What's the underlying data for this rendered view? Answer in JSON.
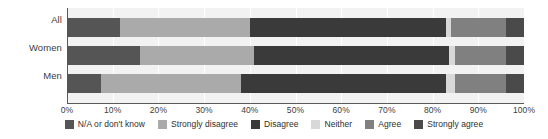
{
  "chart_data": {
    "type": "bar",
    "orientation": "horizontal",
    "stacked": true,
    "stack_mode": "percent",
    "title": "",
    "subtitle": "",
    "xlabel": "",
    "ylabel": "",
    "xlim": [
      0,
      100
    ],
    "xticks": [
      0,
      10,
      20,
      30,
      40,
      50,
      60,
      70,
      80,
      90,
      100
    ],
    "xticklabels": [
      "0%",
      "10%",
      "20%",
      "30%",
      "40%",
      "50%",
      "60%",
      "70%",
      "80%",
      "90%",
      "100%"
    ],
    "grid": true,
    "grid_axis": "x",
    "legend_position": "bottom",
    "categories": [
      "All",
      "Women",
      "Men"
    ],
    "series": [
      {
        "name": "N/A or don't know",
        "color": "#555555",
        "values": [
          11.5,
          16.0,
          7.5
        ]
      },
      {
        "name": "Strongly disagree",
        "color": "#aaaaaa",
        "values": [
          28.5,
          25.0,
          30.5
        ]
      },
      {
        "name": "Disagree",
        "color": "#3a3a3a",
        "values": [
          43.0,
          42.5,
          45.0
        ]
      },
      {
        "name": "Neither",
        "color": "#d8d8d8",
        "values": [
          1.0,
          1.5,
          2.0
        ]
      },
      {
        "name": "Agree",
        "color": "#808080",
        "values": [
          12.0,
          11.0,
          11.0
        ]
      },
      {
        "name": "Strongly agree",
        "color": "#4a4a4a",
        "values": [
          4.0,
          4.0,
          4.0
        ]
      }
    ]
  },
  "legend": {
    "items": [
      {
        "label": "N/A or don't know",
        "color": "#555555"
      },
      {
        "label": "Strongly disagree",
        "color": "#aaaaaa"
      },
      {
        "label": "Disagree",
        "color": "#3a3a3a"
      },
      {
        "label": "Neither",
        "color": "#d8d8d8"
      },
      {
        "label": "Agree",
        "color": "#808080"
      },
      {
        "label": "Strongly agree",
        "color": "#4a4a4a"
      }
    ]
  },
  "style": {
    "plot_background": "#f2f2f2",
    "axis_color": "#5a5a5a",
    "gridline_color": "#ffffff",
    "text_color": "#3c3c3c",
    "page_background": "#ffffff"
  }
}
